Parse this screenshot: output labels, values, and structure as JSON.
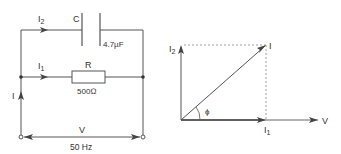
{
  "circuit": {
    "capacitor": {
      "name": "C",
      "value": "4.7µF"
    },
    "resistor": {
      "name": "R",
      "value": "500Ω"
    },
    "currents": {
      "total_main": "I",
      "sub1": "1",
      "sub2": "2",
      "branch_I": "I"
    },
    "supply": {
      "voltage": "V",
      "frequency": "50 Hz"
    }
  },
  "phasor": {
    "i2_label": "I",
    "i2_sub": "2",
    "i_label": "I",
    "i1_label": "I",
    "i1_sub": "1",
    "v_label": "V",
    "angle_label": "ϕ"
  },
  "colors": {
    "line": "#555555",
    "text": "#333333",
    "dashed": "#888888"
  }
}
